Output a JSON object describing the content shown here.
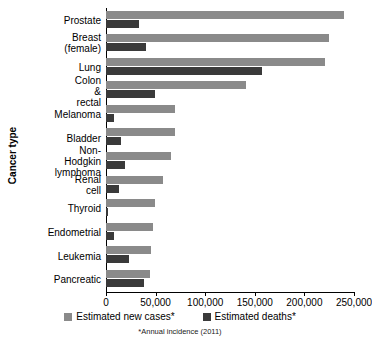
{
  "chart_data": {
    "type": "bar",
    "orientation": "horizontal",
    "title": "",
    "xlabel": "",
    "ylabel": "Cancer type",
    "xlim": [
      0,
      250000
    ],
    "xticks": [
      0,
      50000,
      100000,
      150000,
      200000,
      250000
    ],
    "xtick_labels": [
      "0",
      "50,000",
      "100,000",
      "150,000",
      "200,000",
      "250,000"
    ],
    "grid": false,
    "legend_position": "bottom",
    "footnote": "*Annual incidence (2011)",
    "categories": [
      "Prostate",
      "Breast (female)",
      "Lung",
      "Colon & rectal",
      "Melanoma",
      "Bladder",
      "Non-Hodgkin\nlymphoma",
      "Renal cell",
      "Thyroid",
      "Endometrial",
      "Leukemia",
      "Pancreatic"
    ],
    "series": [
      {
        "name": "Estimated new cases*",
        "color": "#8a8a8a",
        "values": [
          240000,
          225000,
          221000,
          141000,
          70000,
          70000,
          66000,
          57000,
          49000,
          47000,
          45000,
          44000
        ]
      },
      {
        "name": "Estimated deaths*",
        "color": "#3a3a3a",
        "values": [
          33000,
          40000,
          157000,
          49000,
          8000,
          15000,
          19000,
          13000,
          2000,
          8500,
          23000,
          38000
        ]
      }
    ]
  },
  "legend": {
    "items": [
      {
        "label": "Estimated new cases*",
        "color": "#8a8a8a"
      },
      {
        "label": "Estimated deaths*",
        "color": "#3a3a3a"
      }
    ]
  }
}
